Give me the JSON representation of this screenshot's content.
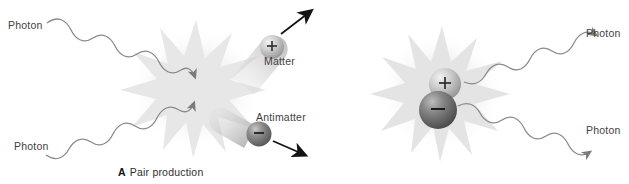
{
  "figure": {
    "background_color": "#ffffff",
    "text_color": "#3f3f3f"
  },
  "panels": [
    {
      "id": "pair-production",
      "caption_letter": "A",
      "caption_text": "Pair production",
      "labels": {
        "photon_in_top": "Photon",
        "photon_in_bottom": "Photon",
        "matter": "Matter",
        "antimatter": "Antimatter"
      },
      "particles": [
        {
          "name": "matter",
          "charge": "+",
          "color": "#b9b9b9"
        },
        {
          "name": "antimatter",
          "charge": "−",
          "color": "#7d7d7d"
        }
      ],
      "burst_color": "#e8e8e8",
      "wave_color": "#8b8b8b",
      "arrow_color": "#1a1a1a"
    },
    {
      "id": "annihilation",
      "caption_letter": "B",
      "caption_text": "Annihilation",
      "labels": {
        "photon_out_top": "Photon",
        "photon_out_bottom": "Photon"
      },
      "particles": [
        {
          "name": "matter",
          "charge": "+",
          "color": "#b9b9b9"
        },
        {
          "name": "antimatter",
          "charge": "−",
          "color": "#7d7d7d"
        }
      ],
      "burst_color": "#e4e4e4",
      "wave_color": "#8b8b8b",
      "arrow_color": "#6f6f6f"
    }
  ]
}
